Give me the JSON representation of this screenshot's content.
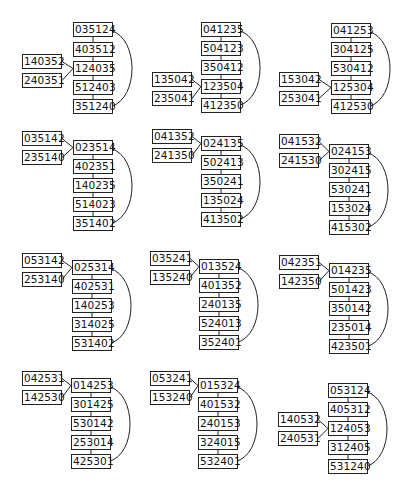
{
  "diagram": {
    "panels": [
      {
        "id": "p1",
        "main": [
          "035124",
          "403512",
          "124035",
          "512403",
          "351240"
        ],
        "side": [
          "140352",
          "240351"
        ],
        "side_target": 2
      },
      {
        "id": "p2",
        "main": [
          "041235",
          "504123",
          "350412",
          "123504",
          "412350"
        ],
        "side": [
          "135042",
          "235041"
        ],
        "side_target": 3
      },
      {
        "id": "p3",
        "main": [
          "041253",
          "304125",
          "530412",
          "125304",
          "412530"
        ],
        "side": [
          "153042",
          "253041"
        ],
        "side_target": 3
      },
      {
        "id": "p4",
        "main": [
          "023514",
          "402351",
          "140235",
          "514023",
          "351402"
        ],
        "side": [
          "035142",
          "235140"
        ],
        "side_target": 0
      },
      {
        "id": "p5",
        "main": [
          "024135",
          "502413",
          "350241",
          "135024",
          "413502"
        ],
        "side": [
          "041352",
          "241350"
        ],
        "side_target": 0
      },
      {
        "id": "p6",
        "main": [
          "024153",
          "302415",
          "530241",
          "153024",
          "415302"
        ],
        "side": [
          "041532",
          "241530"
        ],
        "side_target": 0
      },
      {
        "id": "p7",
        "main": [
          "025314",
          "402531",
          "140253",
          "314025",
          "531402"
        ],
        "side": [
          "053142",
          "253140"
        ],
        "side_target": 0
      },
      {
        "id": "p8",
        "main": [
          "013524",
          "401352",
          "240135",
          "524013",
          "352401"
        ],
        "side": [
          "035241",
          "135240"
        ],
        "side_target": 0
      },
      {
        "id": "p9",
        "main": [
          "014235",
          "501423",
          "350142",
          "235014",
          "423501"
        ],
        "side": [
          "042351",
          "142350"
        ],
        "side_target": 0
      },
      {
        "id": "p10",
        "main": [
          "014253",
          "301425",
          "530142",
          "253014",
          "425301"
        ],
        "side": [
          "042531",
          "142530"
        ],
        "side_target": 0
      },
      {
        "id": "p11",
        "main": [
          "015324",
          "401532",
          "240153",
          "324015",
          "532401"
        ],
        "side": [
          "053241",
          "153240"
        ],
        "side_target": 0
      },
      {
        "id": "p12",
        "main": [
          "053124",
          "405312",
          "124053",
          "312405",
          "531240"
        ],
        "side": [
          "140532",
          "240531"
        ],
        "side_target": 2
      }
    ]
  },
  "layout": {
    "panels": [
      {
        "mx": 73,
        "mtops": [
          22,
          42,
          61,
          80,
          99
        ],
        "sx": 22,
        "stops": [
          54,
          73
        ]
      },
      {
        "mx": 201,
        "mtops": [
          22,
          41,
          60,
          79,
          98
        ],
        "sx": 152,
        "stops": [
          72,
          91
        ]
      },
      {
        "mx": 331,
        "mtops": [
          23,
          42,
          61,
          80,
          99
        ],
        "sx": 279,
        "stops": [
          72,
          91
        ]
      },
      {
        "mx": 73,
        "mtops": [
          140,
          159,
          178,
          197,
          216
        ],
        "sx": 22,
        "stops": [
          131,
          150
        ]
      },
      {
        "mx": 201,
        "mtops": [
          136,
          155,
          174,
          193,
          212
        ],
        "sx": 152,
        "stops": [
          129,
          148
        ]
      },
      {
        "mx": 329,
        "mtops": [
          144,
          163,
          182,
          201,
          220
        ],
        "sx": 279,
        "stops": [
          134,
          153
        ]
      },
      {
        "mx": 72,
        "mtops": [
          260,
          279,
          298,
          317,
          336
        ],
        "sx": 22,
        "stops": [
          253,
          272
        ]
      },
      {
        "mx": 199,
        "mtops": [
          259,
          278,
          297,
          316,
          335
        ],
        "sx": 150,
        "stops": [
          251,
          270
        ]
      },
      {
        "mx": 329,
        "mtops": [
          263,
          282,
          301,
          320,
          339
        ],
        "sx": 279,
        "stops": [
          255,
          274
        ]
      },
      {
        "mx": 71,
        "mtops": [
          378,
          397,
          416,
          435,
          454
        ],
        "sx": 22,
        "stops": [
          371,
          390
        ]
      },
      {
        "mx": 198,
        "mtops": [
          378,
          397,
          416,
          435,
          454
        ],
        "sx": 150,
        "stops": [
          371,
          390
        ]
      },
      {
        "mx": 328,
        "mtops": [
          383,
          402,
          421,
          440,
          459
        ],
        "sx": 278,
        "stops": [
          412,
          431
        ]
      }
    ],
    "box_w": 36,
    "box_h": 13
  }
}
